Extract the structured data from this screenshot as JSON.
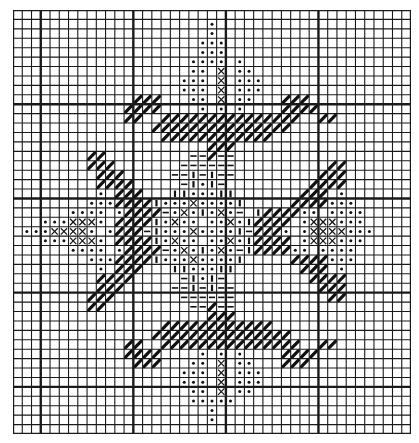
{
  "chart_data": {
    "type": "cross-stitch-pattern",
    "title": "",
    "grid": {
      "columns": 43,
      "rows": 45,
      "major_every": 10,
      "major_col_offset": 3,
      "major_row_offset": 0
    },
    "colors": {
      "line": "#1a1a1a",
      "ink": "#111111",
      "background": "#ffffff"
    },
    "legend": {
      "o": "dot",
      "x": "cross",
      "/": "diagonal-heavy",
      "-": "horizontal-dash",
      "|": "vertical-bar",
      ".": "empty"
    },
    "rows": [
      "...........................................",
      ".....................o.....................",
      ".....................o.....................",
      "....................ooo....................",
      "....................ooo....................",
      "...................oooo o..................",
      "...................oo.x.oo.................",
      "..................ooo.x.ooo................",
      "..................ooo.x.ooo................",
      ".............///...oo.x.oo...///...........",
      "............////....o.o.o....////..........",
      "............//..///////////////..//........",
      "...............///////////////.............",
      "................////////////...............",
      ".....................///...................",
      "........//.........--/--...................",
      "........///.......------..........//.......",
      ".........///.....--|-|--.........///.......",
      ".........////.....-|o|-.........////.......",
      ".........o.///...||ooo||.......///.o.......",
      "........ooo////|oooxoooo|.....////ooo......",
      "......oooo.o////-oxo|oxo-.|////oo.oooo.....",
      "...oooxxxo.////|oxoo.ooxo|////.oxxxooo.....",
      ".oooxxxxo.o///-|oooxoooo|-///o.oxxxxooo....",
      "...oooxxxo.////|oxoo.ooxo|////.oxxxooo.....",
      "......oooo.o////-oxo|oxo-|////oo.oooo......",
      "........ooo////|oooxoooo|.....////ooo......",
      ".........o.///...||ooo||.......///.o.......",
      ".........////.....-|o|-.........////.......",
      ".........///.....--|-|--.........///.......",
      "........///.......------..........//.......",
      "........//.........--/--...................",
      ".....................///...................",
      "................////////////...............",
      "...............///////////////.............",
      "............//..///////////////..//........",
      "............////....o.o.o....////..........",
      ".............///...oo.x.oo...///...........",
      "..................ooo.x.ooo................",
      "..................ooo.x.ooo................",
      "...................oo.x.oo.................",
      "...................ooooo...................",
      ".....................o.....................",
      ".....................o.....................",
      "..........................................."
    ]
  }
}
